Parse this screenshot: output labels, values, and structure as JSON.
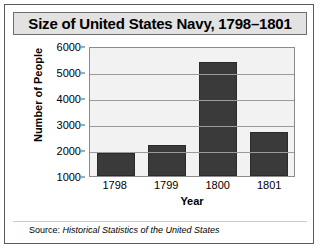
{
  "figure": {
    "title": "Size of United States Navy, 1798–1801",
    "source_label": "Source:",
    "source_title": "Historical Statistics of the United States"
  },
  "chart_data": {
    "type": "bar",
    "title": "Size of United States Navy, 1798–1801",
    "xlabel": "Year",
    "ylabel": "Number of People",
    "categories": [
      "1798",
      "1799",
      "1800",
      "1801"
    ],
    "values": [
      1900,
      2200,
      5400,
      2700
    ],
    "ylim": [
      1000,
      6000
    ],
    "yticks": [
      6000,
      5000,
      4000,
      3000,
      2000,
      1000
    ],
    "ytick_labels": [
      "6000",
      "5000",
      "4000",
      "3000",
      "2000",
      "1000"
    ],
    "grid": true,
    "legend": "none",
    "bar_color": "#3a3a3a",
    "plot_background": "#f2f2f2",
    "gridline_color": "#9a9a9a"
  }
}
